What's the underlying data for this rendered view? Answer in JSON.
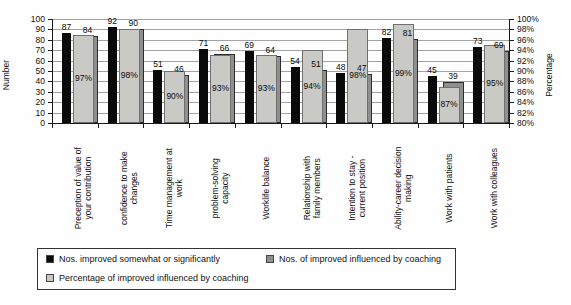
{
  "chart_data": {
    "type": "bar",
    "title": "",
    "categories": [
      [
        "Preception of value of",
        "your contribution"
      ],
      [
        "confidence to make",
        "changes"
      ],
      [
        "Time management at",
        "work"
      ],
      [
        "problem-solving",
        "capacity"
      ],
      [
        "Worklife balance"
      ],
      [
        "Relationship with",
        "family members"
      ],
      [
        "Intention to stay -",
        "current position"
      ],
      [
        "Ability-career decision",
        "making"
      ],
      [
        "Work with patients"
      ],
      [
        "Work with colleagues"
      ]
    ],
    "series": [
      {
        "name": "Nos. improved somewhat or significantly",
        "axis": "left",
        "color": "#0a0a0a",
        "values": [
          87,
          92,
          51,
          71,
          69,
          54,
          48,
          82,
          45,
          73
        ]
      },
      {
        "name": "Nos. of improved influenced by coaching",
        "axis": "left",
        "color": "#8f8f8f",
        "values": [
          84,
          90,
          46,
          66,
          64,
          51,
          47,
          81,
          39,
          69
        ]
      },
      {
        "name": "Percentage of improved influenced by coaching",
        "axis": "right",
        "color": "#c9c9c5",
        "values": [
          97,
          98,
          90,
          93,
          93,
          94,
          98,
          99,
          87,
          95
        ],
        "label_suffix": "%"
      }
    ],
    "left_axis": {
      "title": "Number",
      "min": 0,
      "max": 100,
      "step": 10
    },
    "right_axis": {
      "title": "Percentage",
      "min": 80,
      "max": 100,
      "step": 2,
      "suffix": "%"
    },
    "grid": true,
    "grid_color": "#a3a3a3",
    "legend_position": "bottom"
  }
}
